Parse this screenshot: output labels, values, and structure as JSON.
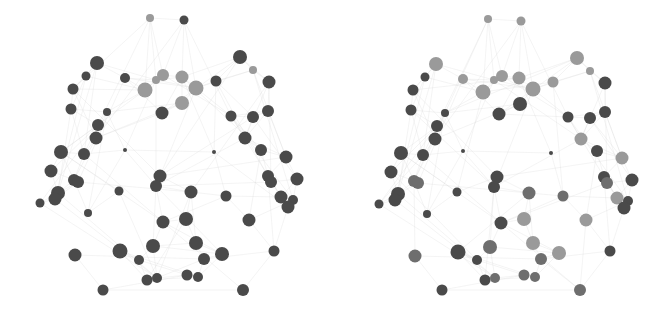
{
  "figure": {
    "background": "#ffffff",
    "edge_color": "#d8d8d8",
    "node_colors": {
      "dark": "#4a4a4a",
      "mid": "#6e6e6e",
      "light": "#9a9a9a"
    }
  },
  "panels": [
    {
      "name": "left",
      "nodes": [
        {
          "x": 150,
          "y": 18,
          "r": 4,
          "c": "light"
        },
        {
          "x": 184,
          "y": 20,
          "r": 4.5,
          "c": "dark"
        },
        {
          "x": 97,
          "y": 63,
          "r": 7,
          "c": "dark"
        },
        {
          "x": 86,
          "y": 76,
          "r": 4.5,
          "c": "dark"
        },
        {
          "x": 125,
          "y": 78,
          "r": 5,
          "c": "dark"
        },
        {
          "x": 240,
          "y": 57,
          "r": 7,
          "c": "dark"
        },
        {
          "x": 253,
          "y": 70,
          "r": 4,
          "c": "light"
        },
        {
          "x": 269,
          "y": 82,
          "r": 6.5,
          "c": "dark"
        },
        {
          "x": 163,
          "y": 75,
          "r": 6,
          "c": "light"
        },
        {
          "x": 156,
          "y": 80,
          "r": 4,
          "c": "light"
        },
        {
          "x": 182,
          "y": 77,
          "r": 6.5,
          "c": "light"
        },
        {
          "x": 145,
          "y": 90,
          "r": 7.5,
          "c": "light"
        },
        {
          "x": 196,
          "y": 88,
          "r": 7.5,
          "c": "light"
        },
        {
          "x": 216,
          "y": 81,
          "r": 5.5,
          "c": "dark"
        },
        {
          "x": 73,
          "y": 89,
          "r": 5.5,
          "c": "dark"
        },
        {
          "x": 182,
          "y": 103,
          "r": 7,
          "c": "light"
        },
        {
          "x": 71,
          "y": 109,
          "r": 5.5,
          "c": "dark"
        },
        {
          "x": 107,
          "y": 112,
          "r": 4,
          "c": "dark"
        },
        {
          "x": 162,
          "y": 113,
          "r": 6.5,
          "c": "dark"
        },
        {
          "x": 231,
          "y": 116,
          "r": 5.5,
          "c": "dark"
        },
        {
          "x": 253,
          "y": 117,
          "r": 6,
          "c": "dark"
        },
        {
          "x": 268,
          "y": 111,
          "r": 6,
          "c": "dark"
        },
        {
          "x": 98,
          "y": 125,
          "r": 6,
          "c": "dark"
        },
        {
          "x": 96,
          "y": 138,
          "r": 6.5,
          "c": "dark"
        },
        {
          "x": 245,
          "y": 138,
          "r": 6.5,
          "c": "dark"
        },
        {
          "x": 125,
          "y": 150,
          "r": 2,
          "c": "dark"
        },
        {
          "x": 214,
          "y": 152,
          "r": 2,
          "c": "dark"
        },
        {
          "x": 61,
          "y": 152,
          "r": 7,
          "c": "dark"
        },
        {
          "x": 84,
          "y": 154,
          "r": 6,
          "c": "dark"
        },
        {
          "x": 261,
          "y": 150,
          "r": 6,
          "c": "dark"
        },
        {
          "x": 286,
          "y": 157,
          "r": 6.5,
          "c": "dark"
        },
        {
          "x": 51,
          "y": 171,
          "r": 6.5,
          "c": "dark"
        },
        {
          "x": 74,
          "y": 180,
          "r": 6,
          "c": "dark"
        },
        {
          "x": 78,
          "y": 182,
          "r": 6,
          "c": "dark"
        },
        {
          "x": 160,
          "y": 176,
          "r": 6.5,
          "c": "dark"
        },
        {
          "x": 268,
          "y": 176,
          "r": 6,
          "c": "dark"
        },
        {
          "x": 271,
          "y": 182,
          "r": 6,
          "c": "dark"
        },
        {
          "x": 297,
          "y": 179,
          "r": 6.5,
          "c": "dark"
        },
        {
          "x": 156,
          "y": 186,
          "r": 6,
          "c": "dark"
        },
        {
          "x": 191,
          "y": 192,
          "r": 6.5,
          "c": "dark"
        },
        {
          "x": 58,
          "y": 193,
          "r": 7,
          "c": "dark"
        },
        {
          "x": 55,
          "y": 199,
          "r": 6.5,
          "c": "dark"
        },
        {
          "x": 119,
          "y": 191,
          "r": 4.5,
          "c": "dark"
        },
        {
          "x": 226,
          "y": 196,
          "r": 5.5,
          "c": "dark"
        },
        {
          "x": 40,
          "y": 203,
          "r": 4.5,
          "c": "dark"
        },
        {
          "x": 281,
          "y": 197,
          "r": 6.5,
          "c": "dark"
        },
        {
          "x": 293,
          "y": 200,
          "r": 5,
          "c": "dark"
        },
        {
          "x": 288,
          "y": 207,
          "r": 6.5,
          "c": "dark"
        },
        {
          "x": 88,
          "y": 213,
          "r": 4,
          "c": "dark"
        },
        {
          "x": 163,
          "y": 222,
          "r": 6.5,
          "c": "dark"
        },
        {
          "x": 186,
          "y": 219,
          "r": 7,
          "c": "dark"
        },
        {
          "x": 249,
          "y": 220,
          "r": 6.5,
          "c": "dark"
        },
        {
          "x": 153,
          "y": 246,
          "r": 7,
          "c": "dark"
        },
        {
          "x": 196,
          "y": 243,
          "r": 7,
          "c": "dark"
        },
        {
          "x": 120,
          "y": 251,
          "r": 7.5,
          "c": "dark"
        },
        {
          "x": 75,
          "y": 255,
          "r": 6.5,
          "c": "dark"
        },
        {
          "x": 139,
          "y": 260,
          "r": 5,
          "c": "dark"
        },
        {
          "x": 204,
          "y": 259,
          "r": 6,
          "c": "dark"
        },
        {
          "x": 222,
          "y": 254,
          "r": 7,
          "c": "dark"
        },
        {
          "x": 274,
          "y": 251,
          "r": 5.5,
          "c": "dark"
        },
        {
          "x": 147,
          "y": 280,
          "r": 5.5,
          "c": "dark"
        },
        {
          "x": 157,
          "y": 278,
          "r": 5,
          "c": "dark"
        },
        {
          "x": 187,
          "y": 275,
          "r": 5.5,
          "c": "dark"
        },
        {
          "x": 198,
          "y": 277,
          "r": 5,
          "c": "dark"
        },
        {
          "x": 103,
          "y": 290,
          "r": 5.5,
          "c": "dark"
        },
        {
          "x": 243,
          "y": 290,
          "r": 6,
          "c": "dark"
        }
      ]
    },
    {
      "name": "right",
      "nodes": [
        {
          "x": 152,
          "y": 19,
          "r": 4,
          "c": "light"
        },
        {
          "x": 185,
          "y": 21,
          "r": 4.5,
          "c": "light"
        },
        {
          "x": 100,
          "y": 64,
          "r": 7,
          "c": "light"
        },
        {
          "x": 89,
          "y": 77,
          "r": 4.5,
          "c": "dark"
        },
        {
          "x": 127,
          "y": 79,
          "r": 5,
          "c": "light"
        },
        {
          "x": 241,
          "y": 58,
          "r": 7,
          "c": "light"
        },
        {
          "x": 254,
          "y": 71,
          "r": 4,
          "c": "light"
        },
        {
          "x": 269,
          "y": 83,
          "r": 6.5,
          "c": "dark"
        },
        {
          "x": 166,
          "y": 76,
          "r": 6,
          "c": "light"
        },
        {
          "x": 158,
          "y": 80,
          "r": 4,
          "c": "light"
        },
        {
          "x": 183,
          "y": 78,
          "r": 6.5,
          "c": "light"
        },
        {
          "x": 147,
          "y": 92,
          "r": 7.5,
          "c": "light"
        },
        {
          "x": 197,
          "y": 89,
          "r": 7.5,
          "c": "light"
        },
        {
          "x": 217,
          "y": 82,
          "r": 5.5,
          "c": "light"
        },
        {
          "x": 77,
          "y": 90,
          "r": 5.5,
          "c": "dark"
        },
        {
          "x": 184,
          "y": 104,
          "r": 7,
          "c": "dark"
        },
        {
          "x": 75,
          "y": 110,
          "r": 5.5,
          "c": "dark"
        },
        {
          "x": 109,
          "y": 113,
          "r": 4,
          "c": "dark"
        },
        {
          "x": 163,
          "y": 114,
          "r": 6.5,
          "c": "dark"
        },
        {
          "x": 232,
          "y": 117,
          "r": 5.5,
          "c": "dark"
        },
        {
          "x": 254,
          "y": 118,
          "r": 6,
          "c": "dark"
        },
        {
          "x": 269,
          "y": 112,
          "r": 6,
          "c": "dark"
        },
        {
          "x": 101,
          "y": 126,
          "r": 6,
          "c": "dark"
        },
        {
          "x": 99,
          "y": 139,
          "r": 6.5,
          "c": "dark"
        },
        {
          "x": 245,
          "y": 139,
          "r": 6.5,
          "c": "light"
        },
        {
          "x": 127,
          "y": 151,
          "r": 2,
          "c": "dark"
        },
        {
          "x": 215,
          "y": 153,
          "r": 2,
          "c": "dark"
        },
        {
          "x": 65,
          "y": 153,
          "r": 7,
          "c": "dark"
        },
        {
          "x": 87,
          "y": 155,
          "r": 6,
          "c": "dark"
        },
        {
          "x": 261,
          "y": 151,
          "r": 6,
          "c": "dark"
        },
        {
          "x": 286,
          "y": 158,
          "r": 6.5,
          "c": "light"
        },
        {
          "x": 55,
          "y": 172,
          "r": 6.5,
          "c": "dark"
        },
        {
          "x": 78,
          "y": 181,
          "r": 6,
          "c": "mid"
        },
        {
          "x": 82,
          "y": 183,
          "r": 6,
          "c": "mid"
        },
        {
          "x": 161,
          "y": 177,
          "r": 6.5,
          "c": "dark"
        },
        {
          "x": 268,
          "y": 177,
          "r": 6,
          "c": "dark"
        },
        {
          "x": 271,
          "y": 183,
          "r": 6,
          "c": "mid"
        },
        {
          "x": 296,
          "y": 180,
          "r": 6.5,
          "c": "dark"
        },
        {
          "x": 158,
          "y": 187,
          "r": 6,
          "c": "dark"
        },
        {
          "x": 193,
          "y": 193,
          "r": 6.5,
          "c": "mid"
        },
        {
          "x": 62,
          "y": 194,
          "r": 7,
          "c": "dark"
        },
        {
          "x": 59,
          "y": 200,
          "r": 6.5,
          "c": "dark"
        },
        {
          "x": 121,
          "y": 192,
          "r": 4.5,
          "c": "dark"
        },
        {
          "x": 227,
          "y": 196,
          "r": 5.5,
          "c": "mid"
        },
        {
          "x": 43,
          "y": 204,
          "r": 4.5,
          "c": "dark"
        },
        {
          "x": 281,
          "y": 198,
          "r": 6.5,
          "c": "light"
        },
        {
          "x": 292,
          "y": 201,
          "r": 5,
          "c": "dark"
        },
        {
          "x": 288,
          "y": 208,
          "r": 6.5,
          "c": "dark"
        },
        {
          "x": 91,
          "y": 214,
          "r": 4,
          "c": "dark"
        },
        {
          "x": 165,
          "y": 223,
          "r": 6.5,
          "c": "dark"
        },
        {
          "x": 188,
          "y": 219,
          "r": 7,
          "c": "light"
        },
        {
          "x": 250,
          "y": 220,
          "r": 6.5,
          "c": "light"
        },
        {
          "x": 154,
          "y": 247,
          "r": 7,
          "c": "mid"
        },
        {
          "x": 197,
          "y": 243,
          "r": 7,
          "c": "light"
        },
        {
          "x": 122,
          "y": 252,
          "r": 7.5,
          "c": "dark"
        },
        {
          "x": 79,
          "y": 256,
          "r": 6.5,
          "c": "mid"
        },
        {
          "x": 141,
          "y": 260,
          "r": 5,
          "c": "dark"
        },
        {
          "x": 205,
          "y": 259,
          "r": 6,
          "c": "mid"
        },
        {
          "x": 223,
          "y": 253,
          "r": 7,
          "c": "light"
        },
        {
          "x": 274,
          "y": 251,
          "r": 5.5,
          "c": "dark"
        },
        {
          "x": 149,
          "y": 280,
          "r": 5.5,
          "c": "dark"
        },
        {
          "x": 159,
          "y": 278,
          "r": 5,
          "c": "mid"
        },
        {
          "x": 188,
          "y": 275,
          "r": 5.5,
          "c": "mid"
        },
        {
          "x": 199,
          "y": 277,
          "r": 5,
          "c": "mid"
        },
        {
          "x": 106,
          "y": 290,
          "r": 5.5,
          "c": "dark"
        },
        {
          "x": 244,
          "y": 290,
          "r": 6,
          "c": "mid"
        }
      ]
    }
  ]
}
